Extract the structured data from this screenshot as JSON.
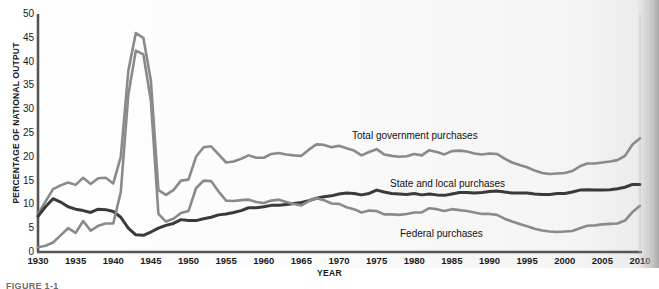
{
  "figure": {
    "caption": "FIGURE 1-1",
    "xaxis_title": "YEAR",
    "yaxis_title": "PERCENTAGE OF NATIONAL OUTPUT"
  },
  "colors": {
    "total": "#8a8a8a",
    "state_local": "#3a3a3a",
    "federal": "#8a8a8a",
    "axis": "#555555",
    "text": "#1a1a1a",
    "background": "#ffffff"
  },
  "labels": {
    "total": "Total government purchases",
    "state_local": "State and local purchases",
    "federal": "Federal purchases"
  },
  "chart_data": {
    "type": "line",
    "title": "",
    "xlabel": "YEAR",
    "ylabel": "PERCENTAGE OF NATIONAL OUTPUT",
    "xlim": [
      1930,
      2010
    ],
    "ylim": [
      0,
      50
    ],
    "yticks": [
      0,
      5,
      10,
      15,
      20,
      25,
      30,
      35,
      40,
      45,
      50
    ],
    "xticks": [
      1930,
      1935,
      1940,
      1945,
      1950,
      1955,
      1960,
      1965,
      1970,
      1975,
      1980,
      1985,
      1990,
      1995,
      2000,
      2005,
      2010
    ],
    "grid": false,
    "legend_position": "inline-annotations",
    "x": [
      1930,
      1931,
      1932,
      1933,
      1934,
      1935,
      1936,
      1937,
      1938,
      1939,
      1940,
      1941,
      1942,
      1943,
      1944,
      1945,
      1946,
      1947,
      1948,
      1949,
      1950,
      1951,
      1952,
      1953,
      1954,
      1955,
      1956,
      1957,
      1958,
      1959,
      1960,
      1961,
      1962,
      1963,
      1964,
      1965,
      1966,
      1967,
      1968,
      1969,
      1970,
      1971,
      1972,
      1973,
      1974,
      1975,
      1976,
      1977,
      1978,
      1979,
      1980,
      1981,
      1982,
      1983,
      1984,
      1985,
      1986,
      1987,
      1988,
      1989,
      1990,
      1991,
      1992,
      1993,
      1994,
      1995,
      1996,
      1997,
      1998,
      1999,
      2000,
      2001,
      2002,
      2003,
      2004,
      2005,
      2006,
      2007,
      2008,
      2009,
      2010
    ],
    "series": [
      {
        "name": "Total government purchases",
        "color": "#8a8a8a",
        "values": [
          8.0,
          10.6,
          13.2,
          14.0,
          14.6,
          14.1,
          15.6,
          14.3,
          15.5,
          15.6,
          14.4,
          20.0,
          38.0,
          46.0,
          45.0,
          36.0,
          13.0,
          12.0,
          13.0,
          15.0,
          15.2,
          20.0,
          22.0,
          22.2,
          20.5,
          18.8,
          19.0,
          19.6,
          20.3,
          19.8,
          19.8,
          20.6,
          20.8,
          20.5,
          20.3,
          20.2,
          21.5,
          22.6,
          22.5,
          22.0,
          22.3,
          21.8,
          21.3,
          20.3,
          21.0,
          21.6,
          20.5,
          20.2,
          20.0,
          20.1,
          20.6,
          20.3,
          21.4,
          21.0,
          20.5,
          21.2,
          21.3,
          21.1,
          20.7,
          20.5,
          20.7,
          20.6,
          19.6,
          18.8,
          18.3,
          17.8,
          17.1,
          16.6,
          16.4,
          16.5,
          16.6,
          17.0,
          18.0,
          18.6,
          18.6,
          18.8,
          19.0,
          19.3,
          20.2,
          22.6,
          23.9
        ]
      },
      {
        "name": "State and local purchases",
        "color": "#3a3a3a",
        "values": [
          7.5,
          9.5,
          11.2,
          10.5,
          9.5,
          9.0,
          8.7,
          8.3,
          9.0,
          8.9,
          8.5,
          7.3,
          5.0,
          3.6,
          3.5,
          4.2,
          5.0,
          5.6,
          6.0,
          6.8,
          6.6,
          6.6,
          7.0,
          7.3,
          7.8,
          8.0,
          8.3,
          8.7,
          9.3,
          9.3,
          9.5,
          9.8,
          9.8,
          10.0,
          10.2,
          10.4,
          10.8,
          11.3,
          11.6,
          11.8,
          12.2,
          12.4,
          12.3,
          12.0,
          12.3,
          13.0,
          12.6,
          12.3,
          12.2,
          12.1,
          12.3,
          12.0,
          12.2,
          12.0,
          11.9,
          12.2,
          12.5,
          12.5,
          12.4,
          12.5,
          12.7,
          12.8,
          12.6,
          12.4,
          12.4,
          12.4,
          12.2,
          12.1,
          12.1,
          12.3,
          12.3,
          12.6,
          13.0,
          13.1,
          13.0,
          13.0,
          13.1,
          13.3,
          13.6,
          14.2,
          14.2
        ]
      },
      {
        "name": "Federal purchases",
        "color": "#8a8a8a",
        "values": [
          1.0,
          1.3,
          2.0,
          3.5,
          5.0,
          4.0,
          6.5,
          4.5,
          5.5,
          6.0,
          6.0,
          12.6,
          33.0,
          42.3,
          41.5,
          31.8,
          8.0,
          6.4,
          7.0,
          8.2,
          8.6,
          13.4,
          15.0,
          14.9,
          12.7,
          10.8,
          10.7,
          10.9,
          11.0,
          10.5,
          10.3,
          10.8,
          11.0,
          10.5,
          10.1,
          9.8,
          10.7,
          11.3,
          10.9,
          10.2,
          10.1,
          9.4,
          9.0,
          8.3,
          8.7,
          8.6,
          7.9,
          7.9,
          7.8,
          8.0,
          8.3,
          8.3,
          9.2,
          9.0,
          8.6,
          9.0,
          8.8,
          8.6,
          8.3,
          8.0,
          8.0,
          7.8,
          7.0,
          6.4,
          5.9,
          5.4,
          4.9,
          4.5,
          4.3,
          4.2,
          4.3,
          4.4,
          5.0,
          5.5,
          5.6,
          5.8,
          5.9,
          6.0,
          6.6,
          8.4,
          9.7
        ]
      }
    ]
  }
}
